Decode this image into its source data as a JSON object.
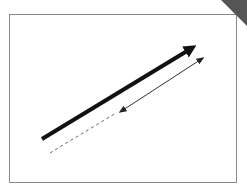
{
  "diagram": {
    "frame": {
      "border_color": "#8a8a8a",
      "background": "#ffffff"
    },
    "corner_fold": {
      "color": "#555555",
      "position": "top-right"
    },
    "arrows": [
      {
        "name": "thick-arrow",
        "style": "solid",
        "weight": "thick",
        "color": "#111111",
        "from": [
          42,
          139
        ],
        "to": [
          196,
          45
        ]
      },
      {
        "name": "thin-arrow",
        "style": "solid",
        "weight": "thin",
        "color": "#333333",
        "from": [
          120,
          112
        ],
        "to": [
          203,
          58
        ],
        "heads": "both"
      },
      {
        "name": "dashed-extension",
        "style": "dashed",
        "weight": "thin",
        "color": "#666666",
        "from": [
          50,
          153
        ],
        "to": [
          118,
          112
        ]
      }
    ]
  }
}
